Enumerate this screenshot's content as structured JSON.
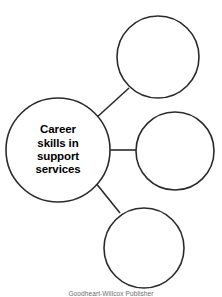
{
  "diagram": {
    "type": "cluster-web",
    "title": "Career skills in support services",
    "background_color": "#ffffff",
    "stroke_color": "#2b2b2b",
    "text_color": "#000000",
    "central_node": {
      "id": "central-node",
      "label_lines": [
        "Career",
        "skills in",
        "support",
        "services"
      ],
      "full_label": "Career skills in support services",
      "cx": 58,
      "cy": 150,
      "r": 52,
      "filled": false
    },
    "satellite_nodes": [
      {
        "id": "satellite-node-top",
        "label": "",
        "cx": 158,
        "cy": 57,
        "r": 41,
        "filled": false
      },
      {
        "id": "satellite-node-middle",
        "label": "",
        "cx": 175,
        "cy": 151,
        "r": 39,
        "filled": false
      },
      {
        "id": "satellite-node-bottom",
        "label": "",
        "cx": 144,
        "cy": 248,
        "r": 40,
        "filled": false
      }
    ],
    "connectors": [
      {
        "id": "connector-top",
        "x1": 95,
        "y1": 119,
        "x2": 129,
        "y2": 88
      },
      {
        "id": "connector-middle",
        "x1": 110,
        "y1": 150,
        "x2": 137,
        "y2": 150
      },
      {
        "id": "connector-bottom",
        "x1": 95,
        "y1": 182,
        "x2": 120,
        "y2": 213
      }
    ]
  },
  "credit": {
    "text": "Goodheart-Willcox Publisher"
  }
}
